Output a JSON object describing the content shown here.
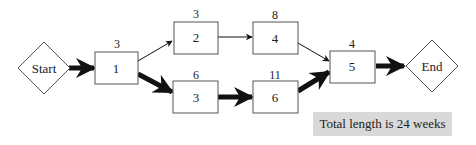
{
  "diagram": {
    "type": "critical-path-network",
    "nodes": {
      "start": {
        "label": "Start"
      },
      "n1": {
        "label": "1",
        "duration": "3"
      },
      "n2": {
        "label": "2",
        "duration": "3"
      },
      "n3": {
        "label": "3",
        "duration": "6"
      },
      "n4": {
        "label": "4",
        "duration": "8"
      },
      "n6": {
        "label": "6",
        "duration": "11"
      },
      "n5": {
        "label": "5",
        "duration": "4"
      },
      "end": {
        "label": "End"
      }
    },
    "edges": [
      {
        "from": "Start",
        "to": "1",
        "critical": true
      },
      {
        "from": "1",
        "to": "2",
        "critical": false
      },
      {
        "from": "1",
        "to": "3",
        "critical": true
      },
      {
        "from": "2",
        "to": "4",
        "critical": false
      },
      {
        "from": "3",
        "to": "6",
        "critical": true
      },
      {
        "from": "4",
        "to": "5",
        "critical": false
      },
      {
        "from": "6",
        "to": "5",
        "critical": true
      },
      {
        "from": "5",
        "to": "End",
        "critical": true
      }
    ],
    "total_label": "Total length is 24 weeks"
  }
}
